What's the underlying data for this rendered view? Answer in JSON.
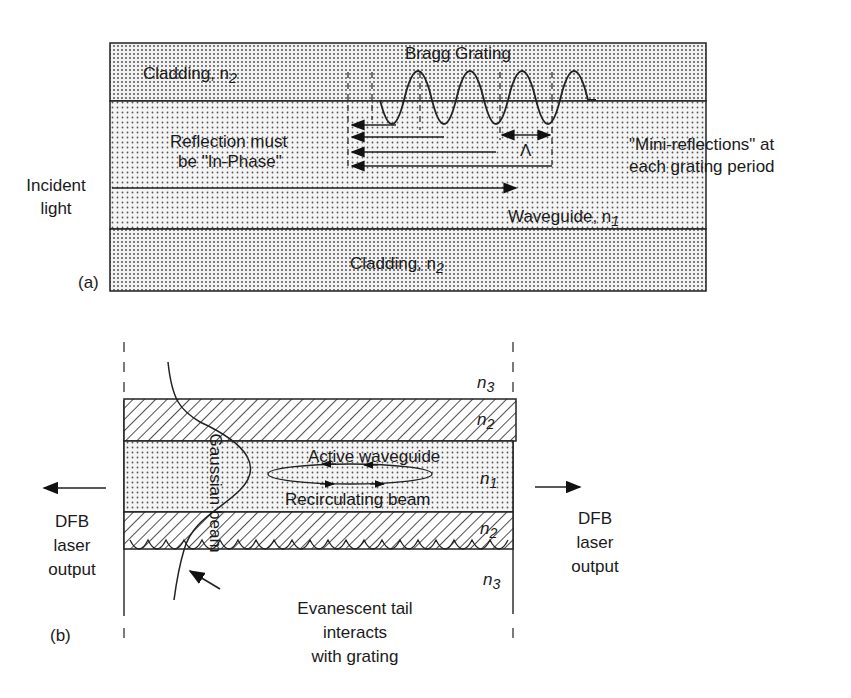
{
  "panel_a": {
    "tag": "(a)",
    "cladding_top": "Cladding, n",
    "cladding_top_sub": "2",
    "grating_label": "Bragg Grating",
    "reflection_line1": "Reflection must",
    "reflection_line2": "be \"In-Phase\"",
    "period_symbol": "Λ",
    "mini_line1": "\"Mini-reflections\" at",
    "mini_line2": "each grating period",
    "incident_line1": "Incident",
    "incident_line2": "light",
    "waveguide": "Waveguide, n",
    "waveguide_sub": "1",
    "cladding_bottom": "Cladding, n",
    "cladding_bottom_sub": "2"
  },
  "panel_b": {
    "tag": "(b)",
    "n3_top": "n",
    "n3_top_sub": "3",
    "n2_top": "n",
    "n2_top_sub": "2",
    "n1": "n",
    "n1_sub": "1",
    "n2_bottom": "n",
    "n2_bottom_sub": "2",
    "n3_bottom": "n",
    "n3_bottom_sub": "3",
    "gaussian_beam": "Gaussian beam",
    "active_waveguide": "Active waveguide",
    "recirculating": "Recirculating beam",
    "left_output": [
      "DFB",
      "laser",
      "output"
    ],
    "right_output": [
      "DFB",
      "laser",
      "output"
    ],
    "evanescent": [
      "Evanescent tail",
      "interacts",
      "with grating"
    ]
  }
}
